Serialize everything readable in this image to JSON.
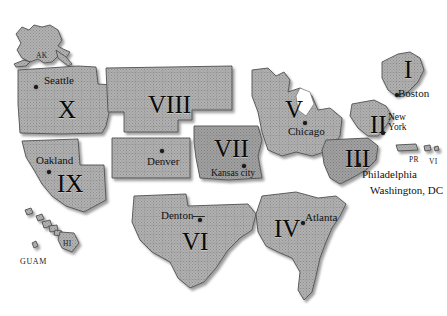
{
  "map": {
    "title": "United States Federal Regions Map",
    "background_color": "#ffffff",
    "land_fill_color": "#a9a9a9",
    "land_stroke_color": "#4a4a4a",
    "label_color": "#000000",
    "shadow_color": "#9a9a9a"
  },
  "regions": [
    {
      "numeral": "I",
      "office": "Boston",
      "num_x": 404,
      "num_y": 57,
      "city_x": 398,
      "city_y": 88,
      "dot_x": 395,
      "dot_y": 93,
      "size": "normal"
    },
    {
      "numeral": "II",
      "office": "New York",
      "num_x": 370,
      "num_y": 112,
      "city_x": 388,
      "city_y": 113,
      "dot_x": 381,
      "dot_y": 131,
      "size": "normal"
    },
    {
      "numeral": "III",
      "office": "Philadelphia",
      "num_x": 345,
      "num_y": 146,
      "city_x": 362,
      "city_y": 169,
      "dot_x": 357,
      "dot_y": 163,
      "size": "normal"
    },
    {
      "numeral": "IV",
      "office": "Atlanta",
      "num_x": 274,
      "num_y": 216,
      "city_x": 305,
      "city_y": 212,
      "dot_x": 301,
      "dot_y": 221,
      "size": "normal"
    },
    {
      "numeral": "V",
      "office": "Chicago",
      "num_x": 285,
      "num_y": 97,
      "city_x": 288,
      "city_y": 126,
      "dot_x": 303,
      "dot_y": 121,
      "size": "normal"
    },
    {
      "numeral": "VI",
      "office": "Denton",
      "num_x": 182,
      "num_y": 229,
      "city_x": 161,
      "city_y": 210,
      "dot_x": 198,
      "dot_y": 218,
      "size": "normal"
    },
    {
      "numeral": "VII",
      "office": "Kansas city",
      "num_x": 214,
      "num_y": 136,
      "city_x": 211,
      "city_y": 169,
      "dot_x": 242,
      "dot_y": 164,
      "size": "normal"
    },
    {
      "numeral": "VIII",
      "office": "Denver",
      "num_x": 148,
      "num_y": 92,
      "city_x": 147,
      "city_y": 156,
      "dot_x": 160,
      "dot_y": 149,
      "size": "normal"
    },
    {
      "numeral": "IX",
      "office": "Oakland",
      "num_x": 57,
      "num_y": 171,
      "city_x": 36,
      "city_y": 155,
      "dot_x": 47,
      "dot_y": 170,
      "size": "normal"
    },
    {
      "numeral": "X",
      "office": "Seattle",
      "num_x": 58,
      "num_y": 97,
      "city_x": 44,
      "city_y": 75,
      "dot_x": 34,
      "dot_y": 85,
      "size": "normal"
    }
  ],
  "extra_cities": [
    {
      "label": "Washington, DC",
      "x": 370,
      "y": 185
    }
  ],
  "territories": [
    {
      "abbr": "AK",
      "x": 36,
      "y": 52,
      "style": "terr"
    },
    {
      "abbr": "HI",
      "x": 63,
      "y": 240,
      "style": "terr"
    },
    {
      "abbr": "GUAM",
      "x": 20,
      "y": 258,
      "style": "terr guam"
    },
    {
      "abbr": "PR",
      "x": 409,
      "y": 156,
      "style": "terr"
    },
    {
      "abbr": "VI",
      "x": 429,
      "y": 158,
      "style": "terr"
    }
  ]
}
